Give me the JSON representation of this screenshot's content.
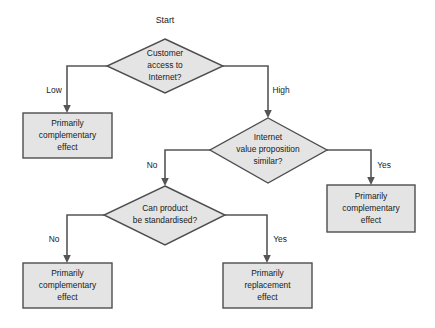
{
  "diagram": {
    "title": "Start",
    "type": "flowchart",
    "canvas": {
      "width": 435,
      "height": 328
    },
    "colors": {
      "node_fill": "#e4e4e4",
      "node_stroke": "#4d4d4d",
      "connector": "#555555",
      "text": "#1a1a1a",
      "background": "#ffffff"
    },
    "start_label": "Start",
    "decisions": [
      {
        "id": "d1",
        "lines": [
          "Customer",
          "access to",
          "Internet?"
        ]
      },
      {
        "id": "d2",
        "lines": [
          "Internet",
          "value proposition",
          "similar?"
        ]
      },
      {
        "id": "d3",
        "lines": [
          "Can product",
          "be standardised?"
        ]
      }
    ],
    "outcomes": [
      {
        "id": "o1",
        "lines": [
          "Primarily",
          "complementary",
          "effect"
        ]
      },
      {
        "id": "o2",
        "lines": [
          "Primarily",
          "complementary",
          "effect"
        ]
      },
      {
        "id": "o3",
        "lines": [
          "Primarily",
          "complementary",
          "effect"
        ]
      },
      {
        "id": "o4",
        "lines": [
          "Primarily",
          "replacement",
          "effect"
        ]
      }
    ],
    "edges": [
      {
        "id": "e1",
        "label": "Low",
        "from": "d1",
        "to": "o1"
      },
      {
        "id": "e2",
        "label": "High",
        "from": "d1",
        "to": "d2"
      },
      {
        "id": "e3",
        "label": "Yes",
        "from": "d2",
        "to": "o2"
      },
      {
        "id": "e4",
        "label": "No",
        "from": "d2",
        "to": "d3"
      },
      {
        "id": "e5",
        "label": "No",
        "from": "d3",
        "to": "o3"
      },
      {
        "id": "e6",
        "label": "Yes",
        "from": "d3",
        "to": "o4"
      }
    ]
  }
}
